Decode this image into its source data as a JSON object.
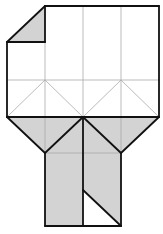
{
  "diagram": {
    "colors": {
      "background": "#ffffff",
      "paper_front": "#ffffff",
      "paper_back": "#d3d3d3",
      "edge": "#111111",
      "crease": "#aaaaaa"
    },
    "grid": {
      "columns_x": [
        7,
        45,
        83,
        121,
        159
      ],
      "rows_y": [
        6,
        42,
        80,
        117,
        153,
        190,
        226
      ]
    },
    "regions": [
      {
        "name": "upper-square",
        "fill": "front",
        "points": "7,42 45,6 159,6 159,117 7,117"
      },
      {
        "name": "folded-corner",
        "fill": "back",
        "points": "7,42 45,6 45,42"
      },
      {
        "name": "lower-flap",
        "fill": "back",
        "points": "7,117 159,117 121,153 45,153"
      },
      {
        "name": "stem-left",
        "fill": "back",
        "points": "45,153 83,117 83,226 45,226"
      },
      {
        "name": "stem-right",
        "fill": "back",
        "points": "83,117 121,153 121,226 83,190"
      },
      {
        "name": "stem-right-white-triangle",
        "fill": "front",
        "points": "83,190 121,226 83,226"
      }
    ],
    "creases": [
      [
        45,
        42,
        45,
        117
      ],
      [
        83,
        6,
        83,
        117
      ],
      [
        121,
        6,
        121,
        117
      ],
      [
        7,
        80,
        159,
        80
      ],
      [
        7,
        117,
        45,
        80
      ],
      [
        45,
        80,
        83,
        117
      ],
      [
        83,
        117,
        121,
        80
      ],
      [
        121,
        80,
        159,
        117
      ],
      [
        7,
        117,
        45,
        153
      ],
      [
        159,
        117,
        121,
        153
      ],
      [
        45,
        117,
        45,
        153
      ],
      [
        121,
        117,
        121,
        153
      ],
      [
        45,
        153,
        121,
        153
      ]
    ],
    "edges": [
      [
        7,
        42,
        45,
        6
      ],
      [
        45,
        6,
        159,
        6
      ],
      [
        159,
        6,
        159,
        117
      ],
      [
        7,
        42,
        7,
        117
      ],
      [
        45,
        6,
        45,
        42
      ],
      [
        7,
        42,
        45,
        42
      ],
      [
        7,
        117,
        159,
        117
      ],
      [
        7,
        117,
        45,
        153
      ],
      [
        45,
        153,
        83,
        117
      ],
      [
        83,
        117,
        121,
        153
      ],
      [
        121,
        153,
        159,
        117
      ],
      [
        45,
        153,
        45,
        226
      ],
      [
        121,
        153,
        121,
        226
      ],
      [
        45,
        226,
        121,
        226
      ],
      [
        83,
        117,
        83,
        226
      ],
      [
        83,
        190,
        121,
        226
      ]
    ]
  }
}
